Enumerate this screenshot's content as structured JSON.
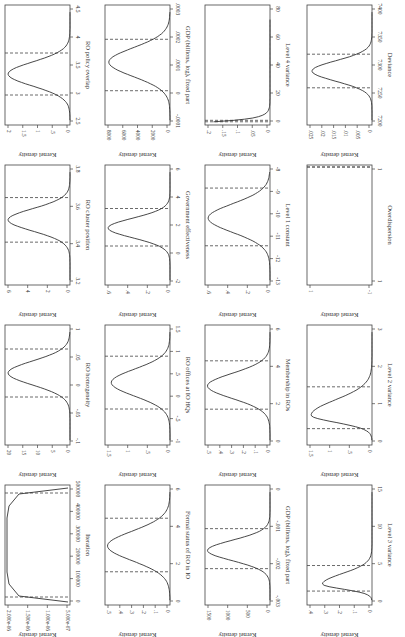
{
  "page": {
    "orientation": "rotated-90-clockwise",
    "background": "#ffffff",
    "line_color": "#333333"
  },
  "chart_data": [
    {
      "id": "p1",
      "type": "line",
      "title": "",
      "xlabel": "RO policy overlap",
      "ylabel": "Kernel density",
      "xticks": [
        "2.5",
        "3",
        "3.5",
        "4",
        "4.5"
      ],
      "xlim": [
        2.5,
        4.5
      ],
      "yticks": [
        "0",
        ".5",
        "1",
        "1.5",
        "2"
      ],
      "ylim": [
        0,
        2.1
      ],
      "peak": {
        "x": 3.35,
        "y": 2.0
      },
      "sd": 0.2,
      "ci": [
        3.0,
        3.7
      ],
      "grid": false,
      "shape": "normal"
    },
    {
      "id": "p2",
      "type": "line",
      "xlabel": "RO cluster position",
      "ylabel": "Kernel density",
      "xticks": [
        "3.2",
        "3.4",
        "3.6",
        "3.8"
      ],
      "xlim": [
        3.15,
        3.85
      ],
      "yticks": [
        "0",
        "2",
        "4",
        "6"
      ],
      "ylim": [
        0,
        6.3
      ],
      "peak": {
        "x": 3.53,
        "y": 6.0
      },
      "sd": 0.065,
      "ci": [
        3.4,
        3.66
      ],
      "shape": "normal"
    },
    {
      "id": "p3",
      "type": "line",
      "xlabel": "RO homogeneity",
      "ylabel": "Kernel density",
      "xticks": [
        "-.1",
        "-.05",
        "0",
        ".05",
        "1"
      ],
      "xlim": [
        -0.1,
        0.1
      ],
      "yticks": [
        "0",
        "5",
        "10",
        "15",
        "20"
      ],
      "ylim": [
        0,
        21
      ],
      "peak": {
        "x": 0.02,
        "y": 20.0
      },
      "sd": 0.02,
      "ci": [
        -0.02,
        0.06
      ],
      "shape": "normal"
    },
    {
      "id": "p4",
      "type": "line",
      "xlabel": "Iteration",
      "ylabel": "Kernel density",
      "xticks": [
        "0",
        "100000",
        "200000",
        "300000",
        "400000",
        "500000"
      ],
      "xlim": [
        -20000,
        520000
      ],
      "yticks": [
        "5.000e-07",
        "1.000e-06",
        "1.500e-06",
        "2.000e-06"
      ],
      "ylim": [
        4.5e-07,
        2.05e-06
      ],
      "ci": [
        0,
        480000
      ],
      "shape": "plateau",
      "plateau_y": 2e-06
    },
    {
      "id": "p5",
      "type": "line",
      "xlabel": "GDP (billions, log), fixed part",
      "ylabel": "Kernel density",
      "xticks": [
        "-.0001",
        "0",
        ".0001",
        ".0002",
        ".0003"
      ],
      "xlim": [
        -0.00012,
        0.0003
      ],
      "yticks": [
        "0",
        "2000",
        "4000",
        "6000",
        "8000"
      ],
      "ylim": [
        0,
        8500
      ],
      "peak": {
        "x": 0.0001,
        "y": 8000
      },
      "sd": 5e-05,
      "ci": [
        0.0,
        0.00018
      ],
      "shape": "normal"
    },
    {
      "id": "p6",
      "type": "line",
      "xlabel": "Government effectiveness",
      "ylabel": "Kernel density",
      "xticks": [
        "-2",
        "0",
        "2",
        "4",
        "6"
      ],
      "xlim": [
        -2,
        6
      ],
      "yticks": [
        "0",
        ".2",
        ".4",
        ".6"
      ],
      "ylim": [
        0,
        0.63
      ],
      "peak": {
        "x": 1.8,
        "y": 0.6
      },
      "sd": 0.65,
      "ci": [
        0.6,
        3.1
      ],
      "shape": "normal"
    },
    {
      "id": "p7",
      "type": "line",
      "xlabel": "RO offices at IO HQs",
      "ylabel": "Kernel density",
      "xticks": [
        "-1",
        "-.5",
        "0",
        ".5",
        "1",
        "1.5"
      ],
      "xlim": [
        -1,
        1.5
      ],
      "yticks": [
        "0",
        ".5",
        "1",
        "1.5"
      ],
      "ylim": [
        0,
        1.55
      ],
      "peak": {
        "x": 0.3,
        "y": 1.4
      },
      "sd": 0.28,
      "ci": [
        -0.25,
        0.85
      ],
      "shape": "normal"
    },
    {
      "id": "p8",
      "type": "line",
      "xlabel": "Formal status of RO in IO",
      "ylabel": "Kernel density",
      "xticks": [
        "0",
        "2",
        "4",
        "6"
      ],
      "xlim": [
        -0.5,
        6
      ],
      "yticks": [
        "0",
        ".1",
        ".2",
        ".3",
        ".4",
        ".5"
      ],
      "ylim": [
        0,
        0.52
      ],
      "peak": {
        "x": 2.7,
        "y": 0.5
      },
      "sd": 0.8,
      "ci": [
        1.3,
        4.2
      ],
      "shape": "normal"
    },
    {
      "id": "p9",
      "type": "line",
      "xlabel": "Level 4 variance",
      "ylabel": "Kernel density",
      "xticks": [
        "0",
        "20",
        "40",
        "60",
        "80"
      ],
      "xlim": [
        -2,
        80
      ],
      "yticks": [
        "0",
        ".05",
        ".1",
        ".15",
        ".2"
      ],
      "ylim": [
        0,
        0.21
      ],
      "ci": [
        0.2,
        1.2
      ],
      "shape": "decay",
      "peak": {
        "x": 0.5,
        "y": 0.2
      },
      "tail_end": 70
    },
    {
      "id": "p10",
      "type": "line",
      "xlabel": "Level 1 constant",
      "ylabel": "Kernel density",
      "xticks": [
        "-13",
        "-12",
        "-11",
        "-10",
        "-9",
        "-8"
      ],
      "xlim": [
        -13,
        -7.8
      ],
      "yticks": [
        "0",
        ".2",
        ".4",
        ".6"
      ],
      "ylim": [
        0,
        0.63
      ],
      "peak": {
        "x": -10.1,
        "y": 0.6
      },
      "sd": 0.62,
      "ci": [
        -11.3,
        -8.8
      ],
      "shape": "normal"
    },
    {
      "id": "p11",
      "type": "line",
      "xlabel": "Membership in ROs",
      "ylabel": "Kernel density",
      "xticks": [
        "0",
        "2",
        "4",
        "6"
      ],
      "xlim": [
        -0.3,
        6.4
      ],
      "yticks": [
        "0",
        ".1",
        ".2",
        ".3",
        ".4",
        ".5"
      ],
      "ylim": [
        0,
        0.52
      ],
      "peak": {
        "x": 3.0,
        "y": 0.5
      },
      "sd": 0.7,
      "ci": [
        1.7,
        4.4
      ],
      "shape": "normal"
    },
    {
      "id": "p12",
      "type": "line",
      "xlabel": "GDP (billions, log), fixed part",
      "ylabel": "Kernel density",
      "xticks": [
        "-.003",
        "-.002",
        "-.001",
        "0"
      ],
      "xlim": [
        -0.0033,
        0
      ],
      "yticks": [
        "0",
        "500",
        "1000",
        "1500"
      ],
      "ylim": [
        0,
        1560
      ],
      "peak": {
        "x": -0.0018,
        "y": 1500
      },
      "sd": 0.00028,
      "ci": [
        -0.0023,
        -0.0012
      ],
      "shape": "normal"
    },
    {
      "id": "p13",
      "type": "line",
      "xlabel": "Deviance",
      "ylabel": "Kernel density",
      "xticks": [
        "7200",
        "7250",
        "7300",
        "7350",
        "7400"
      ],
      "xlim": [
        7200,
        7400
      ],
      "yticks": [
        "0",
        ".005",
        ".01",
        ".015",
        ".02",
        ".025"
      ],
      "ylim": [
        0,
        0.026
      ],
      "peak": {
        "x": 7290,
        "y": 0.024
      },
      "sd": 17,
      "ci": [
        7262,
        7318
      ],
      "shape": "normal"
    },
    {
      "id": "p14",
      "type": "line",
      "xlabel": "Overdispersion",
      "ylabel": "Kernel density",
      "xticks": [
        "1",
        "1"
      ],
      "xlim": [
        0.999,
        1.0005
      ],
      "yticks": [
        "-1",
        "1"
      ],
      "ylim": [
        -1,
        1
      ],
      "ci": [
        1.0,
        1.0
      ],
      "shape": "empty"
    },
    {
      "id": "p15",
      "type": "line",
      "xlabel": "Level 2 variance",
      "ylabel": "Kernel density",
      "xticks": [
        "0",
        "1",
        "2",
        "3"
      ],
      "xlim": [
        -0.1,
        3.2
      ],
      "yticks": [
        "0",
        ".5",
        "1",
        "1.5"
      ],
      "ylim": [
        0,
        1.55
      ],
      "peak": {
        "x": 0.72,
        "y": 1.45
      },
      "sd": 0.28,
      "ci": [
        0.35,
        1.5
      ],
      "shape": "skewed"
    },
    {
      "id": "p16",
      "type": "line",
      "xlabel": "Level 3 variance",
      "ylabel": "Kernel density",
      "xticks": [
        "0",
        "5",
        "10",
        "15"
      ],
      "xlim": [
        -0.5,
        15
      ],
      "yticks": [
        "0",
        ".1",
        ".2",
        ".3",
        ".4"
      ],
      "ylim": [
        0,
        0.42
      ],
      "peak": {
        "x": 2.2,
        "y": 0.32
      },
      "sd": 0.9,
      "ci": [
        1.3,
        4.6
      ],
      "shape": "skewed"
    }
  ]
}
